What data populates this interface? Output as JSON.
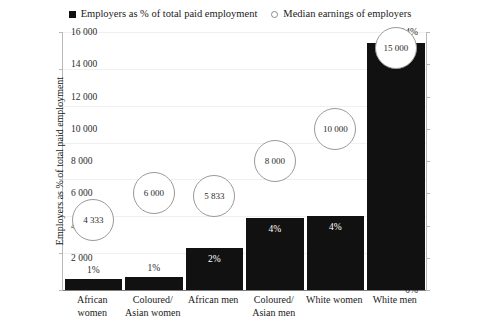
{
  "legend": {
    "bar_series": "Employers as % of total paid employment",
    "bubble_series": "Median earnings of employers",
    "bar_marker": "filled-square-marker",
    "bubble_marker": "open-circle-marker"
  },
  "chart_data": {
    "type": "bar",
    "title": "",
    "xlabel": "",
    "ylabel": "Employers as % of total paid employment",
    "y2label": "Median monthly income of employers (rand)",
    "categories": [
      "African women",
      "Coloured/ Asian women",
      "African men",
      "Coloured/ Asian men",
      "White women",
      "White men"
    ],
    "category_lines": [
      [
        "African women"
      ],
      [
        "Coloured/",
        "Asian women"
      ],
      [
        "African men"
      ],
      [
        "Coloured/",
        "Asian men"
      ],
      [
        "White women"
      ],
      [
        "White men"
      ]
    ],
    "series": [
      {
        "name": "Employers as % of total paid employment",
        "axis": "left",
        "type": "bar",
        "values": [
          0.6,
          0.7,
          2.3,
          3.9,
          4.0,
          13.4
        ],
        "labels": [
          "1%",
          "1%",
          "2%",
          "4%",
          "4%",
          "13%"
        ]
      },
      {
        "name": "Median earnings of employers",
        "axis": "right",
        "type": "bubble",
        "values": [
          4333,
          6000,
          5833,
          8000,
          10000,
          15000
        ],
        "labels": [
          "4 333",
          "6 000",
          "5 833",
          "8 000",
          "10 000",
          "15 000"
        ]
      }
    ],
    "ylim": [
      0,
      14
    ],
    "y2lim": [
      0,
      16000
    ],
    "yticks": [
      0,
      2,
      4,
      6,
      8,
      10,
      12,
      14
    ],
    "ytick_labels": [
      "0%",
      "2%",
      "4%",
      "6%",
      "8%",
      "10%",
      "12%",
      "14%"
    ],
    "y2ticks": [
      0,
      2000,
      4000,
      6000,
      8000,
      10000,
      12000,
      14000,
      16000
    ],
    "y2tick_labels": [
      "",
      "2 000",
      "4 000",
      "6 000",
      "8 000",
      "10 000",
      "12 000",
      "14 000",
      "16 000"
    ],
    "grid": true,
    "legend_position": "top-center",
    "colors": {
      "bar": "#111111",
      "bubble_stroke": "#9a9a9a",
      "bubble_fill": "#ffffff",
      "grid": "#f0f0ee",
      "axis": "#b9b9b9",
      "background": "#ffffff",
      "text": "#1a1a1a"
    }
  }
}
